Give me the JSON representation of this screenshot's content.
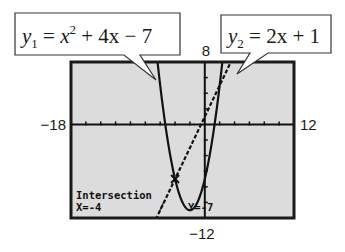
{
  "chart_data": {
    "type": "line",
    "title": "",
    "window": {
      "xmin": -18,
      "xmax": 12,
      "ymin": -12,
      "ymax": 8
    },
    "xlim": [
      -18,
      12
    ],
    "ylim": [
      -12,
      8
    ],
    "x_tick_step": 2,
    "y_tick_step": 2,
    "grid": false,
    "labels": {
      "xmin": "−18",
      "xmax": "12",
      "ymin": "−12",
      "ymax": "8"
    },
    "series": [
      {
        "name": "y1",
        "equation_parts": {
          "lhs": "y",
          "sub": "1",
          "eq": " = ",
          "base": "x",
          "sup": "2",
          "rest": " + 4x  − 7"
        },
        "coefficients": {
          "a": 1,
          "b": 4,
          "c": -7
        },
        "kind": "quadratic"
      },
      {
        "name": "y2",
        "equation_parts": {
          "lhs": "y",
          "sub": "2",
          "eq": " = ",
          "base": "",
          "sup": "",
          "rest": "2x + 1"
        },
        "coefficients": {
          "a": 0,
          "b": 2,
          "c": 1
        },
        "kind": "linear"
      }
    ],
    "intersection": {
      "x": -4,
      "y": -7
    },
    "annotations": {
      "lcd_line1": "Intersection",
      "lcd_x": "X=-4",
      "lcd_y": "Y=-7"
    }
  },
  "colors": {
    "lcd_background": "#dcdcdc",
    "lcd_border": "#1a1a1a",
    "ink": "#111111"
  }
}
